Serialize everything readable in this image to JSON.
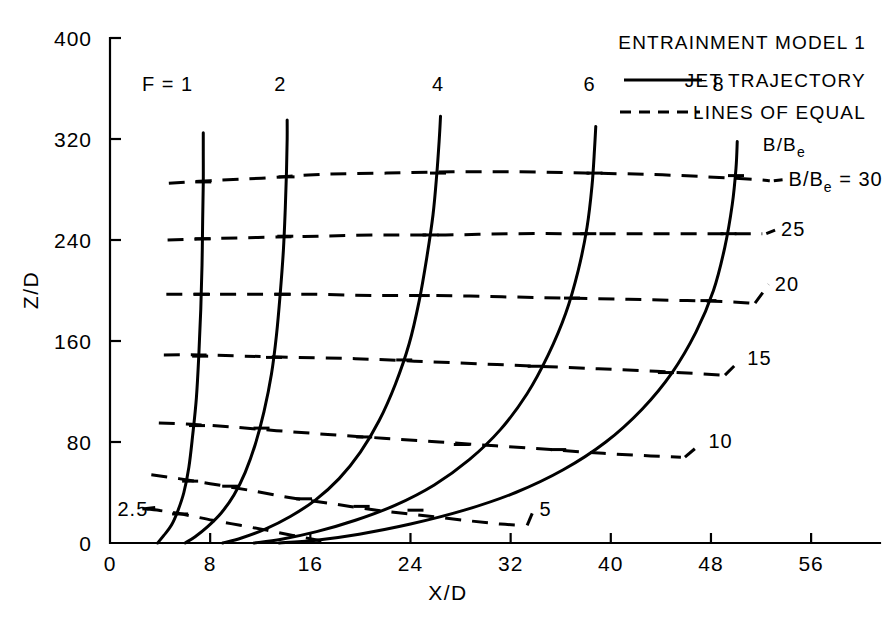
{
  "figure": {
    "background_color": "#ffffff",
    "ink_color": "#000000"
  },
  "chart_data": {
    "type": "line",
    "title": "",
    "xlabel": "X/D",
    "ylabel": "Z/D",
    "xlim": [
      0,
      60
    ],
    "ylim": [
      0,
      400
    ],
    "grid": false,
    "xticks": [
      0,
      8,
      16,
      24,
      32,
      40,
      48,
      56
    ],
    "xtick_labels": [
      "0",
      "8",
      "16",
      "24",
      "32",
      "40",
      "48",
      "56"
    ],
    "yticks": [
      0,
      80,
      160,
      240,
      320,
      400
    ],
    "ytick_labels": [
      "0",
      "80",
      "160",
      "240",
      "320",
      "400"
    ],
    "legend": {
      "position": "top-right",
      "title": "ENTRAINMENT MODEL 1",
      "entries": [
        {
          "style": "solid",
          "label": "JET TRAJECTORY"
        },
        {
          "style": "dashed",
          "label": "LINES OF EQUAL",
          "label2": "B/B",
          "label2_sub": "e"
        }
      ]
    },
    "series": [
      {
        "name": "F = 1",
        "style": "solid",
        "label": "F = 1",
        "label_x": 4.6,
        "label_y": 358,
        "points": [
          [
            3.8,
            0
          ],
          [
            4.3,
            6
          ],
          [
            4.9,
            14
          ],
          [
            5.4,
            25
          ],
          [
            5.9,
            40
          ],
          [
            6.3,
            60
          ],
          [
            6.6,
            85
          ],
          [
            6.9,
            115
          ],
          [
            7.1,
            150
          ],
          [
            7.25,
            185
          ],
          [
            7.35,
            220
          ],
          [
            7.4,
            255
          ],
          [
            7.45,
            285
          ],
          [
            7.45,
            310
          ],
          [
            7.45,
            325
          ]
        ]
      },
      {
        "name": "F = 2",
        "style": "solid",
        "label": "2",
        "label_x": 13.6,
        "label_y": 358,
        "points": [
          [
            6.0,
            0
          ],
          [
            6.8,
            5
          ],
          [
            7.8,
            13
          ],
          [
            8.9,
            24
          ],
          [
            9.9,
            38
          ],
          [
            10.8,
            56
          ],
          [
            11.6,
            78
          ],
          [
            12.3,
            104
          ],
          [
            12.9,
            134
          ],
          [
            13.3,
            165
          ],
          [
            13.6,
            198
          ],
          [
            13.85,
            232
          ],
          [
            14.0,
            265
          ],
          [
            14.1,
            295
          ],
          [
            14.15,
            320
          ],
          [
            14.15,
            335
          ]
        ]
      },
      {
        "name": "F = 4",
        "style": "solid",
        "label": "4",
        "label_x": 26.2,
        "label_y": 358,
        "points": [
          [
            9.0,
            0
          ],
          [
            10.5,
            4
          ],
          [
            12.4,
            11
          ],
          [
            14.4,
            21
          ],
          [
            16.4,
            34
          ],
          [
            18.3,
            51
          ],
          [
            20.0,
            72
          ],
          [
            21.5,
            97
          ],
          [
            22.8,
            126
          ],
          [
            23.9,
            158
          ],
          [
            24.7,
            192
          ],
          [
            25.3,
            226
          ],
          [
            25.8,
            260
          ],
          [
            26.1,
            292
          ],
          [
            26.3,
            320
          ],
          [
            26.4,
            338
          ]
        ]
      },
      {
        "name": "F = 6",
        "style": "solid",
        "label": "6",
        "label_x": 38.3,
        "label_y": 358,
        "points": [
          [
            11.5,
            0
          ],
          [
            13.7,
            3
          ],
          [
            16.5,
            9
          ],
          [
            19.6,
            18
          ],
          [
            22.8,
            30
          ],
          [
            25.9,
            46
          ],
          [
            28.7,
            66
          ],
          [
            31.2,
            90
          ],
          [
            33.3,
            118
          ],
          [
            35.0,
            149
          ],
          [
            36.4,
            182
          ],
          [
            37.4,
            216
          ],
          [
            38.1,
            250
          ],
          [
            38.5,
            283
          ],
          [
            38.7,
            312
          ],
          [
            38.8,
            330
          ]
        ]
      },
      {
        "name": "F = 8",
        "style": "solid",
        "label": "8",
        "label_x": 48.6,
        "label_y": 358,
        "points": [
          [
            13.5,
            0
          ],
          [
            16.3,
            2
          ],
          [
            19.9,
            7
          ],
          [
            24.0,
            15
          ],
          [
            28.3,
            26
          ],
          [
            32.4,
            40
          ],
          [
            36.2,
            58
          ],
          [
            39.6,
            80
          ],
          [
            42.5,
            106
          ],
          [
            44.9,
            135
          ],
          [
            46.8,
            167
          ],
          [
            48.2,
            200
          ],
          [
            49.1,
            234
          ],
          [
            49.7,
            268
          ],
          [
            50.0,
            297
          ],
          [
            50.1,
            318
          ]
        ]
      }
    ],
    "contours": [
      {
        "name": "B/Be = 2.5",
        "style": "dashed",
        "label": "2.5",
        "label_side": "left",
        "label_x": 0.6,
        "label_y": 27,
        "points": [
          [
            2.9,
            27
          ],
          [
            4.5,
            25
          ],
          [
            6.2,
            22
          ],
          [
            8.2,
            18
          ],
          [
            10.4,
            14
          ],
          [
            12.6,
            10
          ],
          [
            14.6,
            6
          ],
          [
            16.2,
            3
          ],
          [
            17.2,
            1
          ]
        ]
      },
      {
        "name": "B/Be = 5",
        "style": "dashed",
        "label": "5",
        "label_side": "right",
        "label_x": 34.3,
        "label_y": 21,
        "points": [
          [
            3.3,
            54
          ],
          [
            5.5,
            51
          ],
          [
            8.0,
            47
          ],
          [
            11.0,
            42
          ],
          [
            14.3,
            36
          ],
          [
            17.8,
            31
          ],
          [
            21.3,
            26
          ],
          [
            24.8,
            22
          ],
          [
            28.3,
            18
          ],
          [
            31.2,
            15
          ],
          [
            33.0,
            14
          ]
        ]
      },
      {
        "name": "B/Be = 10",
        "style": "dashed",
        "label": "10",
        "label_side": "right",
        "label_x": 47.8,
        "label_y": 75,
        "points": [
          [
            3.9,
            95
          ],
          [
            6.5,
            94
          ],
          [
            9.6,
            92
          ],
          [
            13.3,
            89
          ],
          [
            17.4,
            86
          ],
          [
            21.8,
            83
          ],
          [
            26.3,
            80
          ],
          [
            30.8,
            77
          ],
          [
            35.2,
            74
          ],
          [
            39.4,
            71
          ],
          [
            43.2,
            69
          ],
          [
            45.6,
            68
          ]
        ]
      },
      {
        "name": "B/Be = 15",
        "style": "dashed",
        "label": "15",
        "label_side": "right",
        "label_x": 50.9,
        "label_y": 141,
        "points": [
          [
            4.3,
            149
          ],
          [
            7.2,
            149
          ],
          [
            10.8,
            148
          ],
          [
            15.0,
            147
          ],
          [
            19.6,
            146
          ],
          [
            24.4,
            144
          ],
          [
            29.3,
            142
          ],
          [
            34.2,
            140
          ],
          [
            39.0,
            138
          ],
          [
            43.6,
            136
          ],
          [
            47.2,
            134
          ],
          [
            48.8,
            133
          ]
        ]
      },
      {
        "name": "B/Be = 20",
        "style": "dashed",
        "label": "20",
        "label_side": "right",
        "label_x": 53.1,
        "label_y": 200,
        "points": [
          [
            4.5,
            197
          ],
          [
            7.6,
            197
          ],
          [
            11.5,
            197
          ],
          [
            16.1,
            197
          ],
          [
            21.0,
            196
          ],
          [
            26.1,
            196
          ],
          [
            31.3,
            195
          ],
          [
            36.4,
            194
          ],
          [
            41.4,
            193
          ],
          [
            46.1,
            192
          ],
          [
            49.7,
            191
          ],
          [
            51.2,
            190
          ]
        ]
      },
      {
        "name": "B/Be = 25",
        "style": "dashed",
        "label": "25",
        "label_side": "right",
        "label_x": 53.6,
        "label_y": 243,
        "points": [
          [
            4.6,
            240
          ],
          [
            7.8,
            241
          ],
          [
            11.8,
            242
          ],
          [
            16.6,
            243
          ],
          [
            21.6,
            244
          ],
          [
            26.8,
            244
          ],
          [
            32.1,
            245
          ],
          [
            37.3,
            245
          ],
          [
            42.4,
            245
          ],
          [
            47.2,
            245
          ],
          [
            50.8,
            245
          ],
          [
            52.1,
            245
          ]
        ]
      },
      {
        "name": "B/Be = 30",
        "style": "dashed",
        "label": "B/B",
        "label_sub": "e",
        "label_eq": "= 30",
        "label_side": "right",
        "label_x": 54.2,
        "label_y": 283,
        "points": [
          [
            4.7,
            285
          ],
          [
            8.0,
            287
          ],
          [
            12.1,
            289
          ],
          [
            17.0,
            292
          ],
          [
            22.1,
            293
          ],
          [
            27.4,
            294
          ],
          [
            32.7,
            294
          ],
          [
            37.9,
            293
          ],
          [
            43.0,
            292
          ],
          [
            47.8,
            290
          ],
          [
            51.4,
            288
          ],
          [
            52.7,
            287
          ]
        ]
      }
    ],
    "crossings": [
      {
        "series": "F = 1",
        "contour": 2.5,
        "x": 5.6,
        "y": 23
      },
      {
        "series": "F = 1",
        "contour": 5,
        "x": 6.4,
        "y": 49
      },
      {
        "series": "F = 1",
        "contour": 10,
        "x": 6.95,
        "y": 93
      },
      {
        "series": "F = 1",
        "contour": 15,
        "x": 7.2,
        "y": 148
      },
      {
        "series": "F = 1",
        "contour": 20,
        "x": 7.35,
        "y": 197
      },
      {
        "series": "F = 1",
        "contour": 25,
        "x": 7.4,
        "y": 241
      },
      {
        "series": "F = 1",
        "contour": 30,
        "x": 7.45,
        "y": 286
      },
      {
        "series": "F = 2",
        "contour": 5,
        "x": 9.6,
        "y": 45
      },
      {
        "series": "F = 2",
        "contour": 10,
        "x": 12.1,
        "y": 91
      },
      {
        "series": "F = 2",
        "contour": 15,
        "x": 13.1,
        "y": 147
      },
      {
        "series": "F = 2",
        "contour": 20,
        "x": 13.8,
        "y": 197
      },
      {
        "series": "F = 2",
        "contour": 25,
        "x": 14.0,
        "y": 243
      },
      {
        "series": "F = 2",
        "contour": 30,
        "x": 14.1,
        "y": 290
      },
      {
        "series": "F = 4",
        "contour": 5,
        "x": 15.5,
        "y": 35
      },
      {
        "series": "F = 4",
        "contour": 10,
        "x": 20.3,
        "y": 84
      },
      {
        "series": "F = 4",
        "contour": 15,
        "x": 23.5,
        "y": 145
      },
      {
        "series": "F = 4",
        "contour": 20,
        "x": 24.9,
        "y": 196
      },
      {
        "series": "F = 4",
        "contour": 25,
        "x": 25.6,
        "y": 244
      },
      {
        "series": "F = 4",
        "contour": 30,
        "x": 26.2,
        "y": 293
      },
      {
        "series": "F = 6",
        "contour": 5,
        "x": 20.1,
        "y": 29
      },
      {
        "series": "F = 6",
        "contour": 10,
        "x": 28.1,
        "y": 78
      },
      {
        "series": "F = 6",
        "contour": 15,
        "x": 34.0,
        "y": 140
      },
      {
        "series": "F = 6",
        "contour": 20,
        "x": 36.9,
        "y": 194
      },
      {
        "series": "F = 6",
        "contour": 25,
        "x": 38.2,
        "y": 245
      },
      {
        "series": "F = 6",
        "contour": 30,
        "x": 38.7,
        "y": 293
      },
      {
        "series": "F = 8",
        "contour": 5,
        "x": 24.4,
        "y": 26
      },
      {
        "series": "F = 8",
        "contour": 10,
        "x": 35.8,
        "y": 74
      },
      {
        "series": "F = 8",
        "contour": 15,
        "x": 44.4,
        "y": 135
      },
      {
        "series": "F = 8",
        "contour": 20,
        "x": 47.8,
        "y": 192
      },
      {
        "series": "F = 8",
        "contour": 25,
        "x": 49.4,
        "y": 245
      },
      {
        "series": "F = 8",
        "contour": 30,
        "x": 50.0,
        "y": 291
      }
    ]
  },
  "labels": {
    "y_axis_title": "Z/D",
    "x_axis_title": "X/D",
    "legend_title": "ENTRAINMENT MODEL 1",
    "legend_jet": "JET TRAJECTORY",
    "legend_lines": "LINES OF EQUAL",
    "legend_bbe_main": "B/B",
    "legend_bbe_sub": "e"
  }
}
